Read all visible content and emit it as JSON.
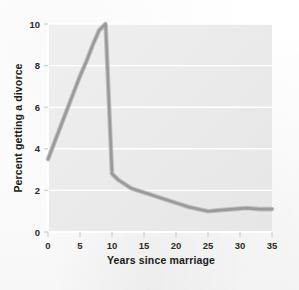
{
  "figure": {
    "name": "divorce-rate-line-chart",
    "background_color": "#ffffff",
    "plot_background_color": "#ececec",
    "gridline_color": "#ffffff",
    "line_color": "#9a9a9a"
  },
  "chart_data": {
    "type": "line",
    "title": "",
    "subtitle": "",
    "xlabel": "Years since marriage",
    "ylabel": "Percent getting a divorce",
    "xlim": [
      0,
      35
    ],
    "ylim": [
      0,
      10
    ],
    "xticks": [
      0,
      5,
      10,
      15,
      20,
      25,
      30,
      35
    ],
    "yticks": [
      0,
      2,
      4,
      6,
      8,
      10
    ],
    "xtick_labels": [
      "0",
      "5",
      "10",
      "15",
      "20",
      "25",
      "30",
      "35"
    ],
    "ytick_labels": [
      "0",
      "2",
      "4",
      "6",
      "8",
      "10"
    ],
    "grid": "horizontal",
    "legend": "none",
    "series": [
      {
        "name": "Percent getting a divorce",
        "color": "#9a9a9a",
        "x": [
          0,
          1,
          2,
          3,
          4,
          5,
          6,
          7,
          8,
          9,
          10,
          11,
          12,
          13,
          14,
          15,
          16,
          17,
          18,
          20,
          22,
          25,
          27,
          29,
          31,
          33,
          35
        ],
        "y": [
          3.5,
          4.3,
          5.1,
          5.9,
          6.7,
          7.5,
          8.2,
          9.0,
          9.7,
          10.0,
          2.8,
          2.5,
          2.3,
          2.1,
          2.0,
          1.9,
          1.8,
          1.7,
          1.6,
          1.4,
          1.2,
          1.0,
          1.05,
          1.1,
          1.15,
          1.1,
          1.1
        ]
      }
    ],
    "annotations": []
  }
}
